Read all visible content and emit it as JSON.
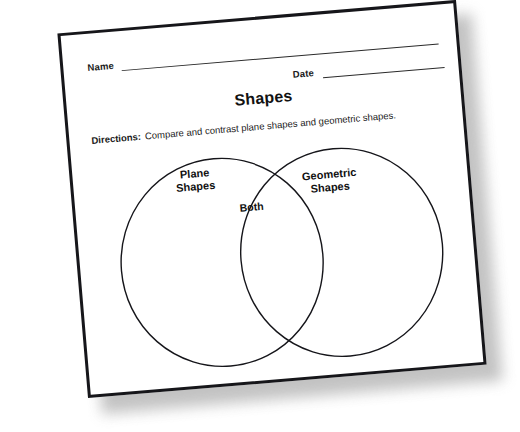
{
  "worksheet": {
    "name_label": "Name",
    "date_label": "Date",
    "title": "Shapes",
    "directions_label": "Directions:",
    "directions_text": "Compare and contrast plane shapes and geometric shapes.",
    "venn": {
      "left_label": "Plane\nShapes",
      "right_label": "Geometric\nShapes",
      "overlap_label": "Both"
    }
  }
}
